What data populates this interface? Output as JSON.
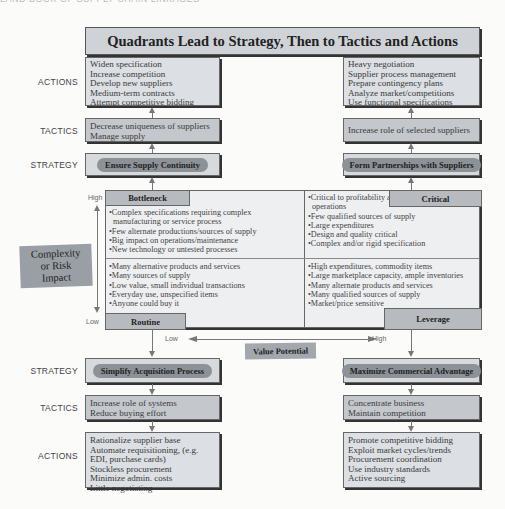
{
  "header": {
    "faded_text": "LAND BOOK OF SUPPLY CHAIN LINKAGES"
  },
  "title": "Quadrants Lead to Strategy, Then to Tactics and Actions",
  "row_labels": {
    "actions": "ACTIONS",
    "tactics": "TACTICS",
    "strategy": "STRATEGY"
  },
  "top_left": {
    "actions": [
      "Widen specification",
      "Increase competition",
      "Develop new suppliers",
      "Medium-term contracts",
      "Attempt competitive bidding"
    ],
    "tactics": [
      "Decrease uniqueness of suppliers",
      "Manage supply"
    ],
    "strategy": "Ensure Supply Continuity"
  },
  "top_right": {
    "actions": [
      "Heavy negotiation",
      "Supplier process management",
      "Prepare contingency plans",
      "Analyze market/competitions",
      "Use functional specifications"
    ],
    "tactics": [
      "Increase role of selected suppliers"
    ],
    "strategy": "Form Partnerships with Suppliers"
  },
  "matrix": {
    "y_axis": {
      "label": "Complexity or Risk Impact",
      "label_line1": "Complexity",
      "label_line2": "or Risk Impact",
      "high": "High",
      "low": "Low"
    },
    "x_axis": {
      "label": "Value Potential",
      "low": "Low",
      "high": "High"
    },
    "quadrants": {
      "bottleneck": {
        "label": "Bottleneck",
        "items": [
          "•Complex specifications requiring complex",
          "  manufacturing or service process",
          "•Few alternate productions/sources of supply",
          "•Big impact on operations/maintenance",
          "•New technology or untested processes"
        ]
      },
      "critical": {
        "label": "Critical",
        "items": [
          "•Critical to profitability and",
          "  operations",
          "•Few qualified sources of supply",
          "•Large expenditures",
          "•Design and quality critical",
          "•Complex and/or rigid specification"
        ]
      },
      "routine": {
        "label": "Routine",
        "items": [
          "•Many alternative products and services",
          "•Many sources of supply",
          "•Low value, small individual transactions",
          "•Everyday use, unspecified items",
          "•Anyone could buy it"
        ]
      },
      "leverage": {
        "label": "Leverage",
        "items": [
          "•High expenditures, commodity items",
          "•Large marketplace capacity, ample inventories",
          "•Many alternate products and services",
          "•Many qualified sources of supply",
          "•Market/price sensitive"
        ]
      }
    }
  },
  "bottom_left": {
    "strategy": "Simplify Acquisition Process",
    "tactics": [
      "Increase role of systems",
      "Reduce buying effort"
    ],
    "actions": [
      "Rationalize supplier base",
      "Automate requisitioning, (e.g.",
      "EDI, purchase cards)",
      "Stockless procurement",
      "Minimize admin. costs",
      "Little negotiating"
    ]
  },
  "bottom_right": {
    "strategy": "Maximize Commercial Advantage",
    "tactics": [
      "Concentrate business",
      "Maintain competition"
    ],
    "actions": [
      "Promote competitive bidding",
      "Exploit market cycles/trends",
      "Procurement coordination",
      "Use industry standards",
      "Active sourcing"
    ]
  },
  "colors": {
    "box_fill": "#dcdfe3",
    "tactic_fill": "#c4c8cd",
    "highlight": "#8c9298",
    "border": "#666666",
    "shadow": "#333333",
    "arrow": "#777777"
  }
}
